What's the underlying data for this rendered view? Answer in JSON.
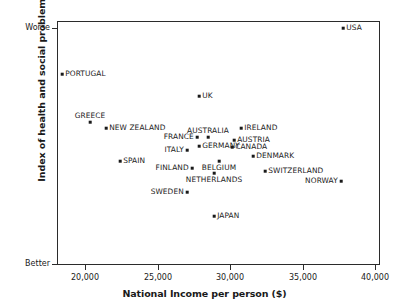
{
  "chart_data": {
    "type": "scatter",
    "title": "",
    "xlabel": "National Income per person ($)",
    "ylabel": "Index of health and social problems",
    "xlim": [
      17900,
      40500
    ],
    "ylim": [
      0,
      1
    ],
    "grid": false,
    "legend": "none",
    "x_ticks": [
      {
        "value": 20000,
        "label": "20,000",
        "px": 85
      },
      {
        "value": 25000,
        "label": "25,000",
        "px": 158
      },
      {
        "value": 30000,
        "label": "30,000",
        "px": 230
      },
      {
        "value": 35000,
        "label": "35,000",
        "px": 303
      },
      {
        "value": 40000,
        "label": "40,000",
        "px": 375
      }
    ],
    "y_ticks": [
      {
        "label": "Worse",
        "px": 28
      },
      {
        "label": "Better",
        "px": 264
      }
    ],
    "points": [
      {
        "name": "USA",
        "x": 37700,
        "y_px": 27,
        "px": 342,
        "label_pos": "right"
      },
      {
        "name": "PORTUGAL",
        "x": 18200,
        "y_px": 73,
        "px": 61,
        "label_pos": "right"
      },
      {
        "name": "UK",
        "x": 27550,
        "y_px": 95,
        "px": 198,
        "label_pos": "right"
      },
      {
        "name": "GREECE",
        "x": 19950,
        "y_px": 121,
        "px": 89,
        "label_pos": "above"
      },
      {
        "name": "NEW ZEALAND",
        "x": 21100,
        "y_px": 127,
        "px": 105,
        "label_pos": "right"
      },
      {
        "name": "IRELAND",
        "x": 30450,
        "y_px": 127,
        "px": 240,
        "label_pos": "right"
      },
      {
        "name": "AUSTRALIA",
        "x": 28200,
        "y_px": 136,
        "px": 207,
        "label_pos": "above"
      },
      {
        "name": "FRANCE",
        "x": 27000,
        "y_px": 136,
        "px": 196,
        "label_pos": "left"
      },
      {
        "name": "AUSTRIA",
        "x": 29650,
        "y_px": 139,
        "px": 233,
        "label_pos": "right"
      },
      {
        "name": "GERMANY",
        "x": 27150,
        "y_px": 145,
        "px": 198,
        "label_pos": "right"
      },
      {
        "name": "CANADA",
        "x": 29500,
        "y_px": 146,
        "px": 231,
        "label_pos": "right"
      },
      {
        "name": "ITALY",
        "x": 26200,
        "y_px": 149,
        "px": 186,
        "label_pos": "left"
      },
      {
        "name": "DENMARK",
        "x": 31000,
        "y_px": 155,
        "px": 252,
        "label_pos": "right"
      },
      {
        "name": "SPAIN",
        "x": 22150,
        "y_px": 160,
        "px": 119,
        "label_pos": "right"
      },
      {
        "name": "BELGIUM",
        "x": 28950,
        "y_px": 160,
        "px": 218,
        "label_pos": "below"
      },
      {
        "name": "FINLAND",
        "x": 27000,
        "y_px": 167,
        "px": 191,
        "label_pos": "left"
      },
      {
        "name": "SWITZERLAND",
        "x": 32200,
        "y_px": 170,
        "px": 264,
        "label_pos": "right"
      },
      {
        "name": "NETHERLANDS",
        "x": 28500,
        "y_px": 172,
        "px": 213,
        "label_pos": "below"
      },
      {
        "name": "NORWAY",
        "x": 37450,
        "y_px": 180,
        "px": 340,
        "label_pos": "left"
      },
      {
        "name": "SWEDEN",
        "x": 26850,
        "y_px": 191,
        "px": 186,
        "label_pos": "left"
      },
      {
        "name": "JAPAN",
        "x": 28500,
        "y_px": 215,
        "px": 213,
        "label_pos": "right"
      }
    ]
  },
  "axes": {
    "x_title": "National Income per person ($)",
    "y_title": "Index of health and social problems",
    "y_top_label": "Worse",
    "y_bottom_label": "Better"
  },
  "style": {
    "ink": "#1a1a1a",
    "frame": "#2b2b2b",
    "background": "#ffffff"
  }
}
